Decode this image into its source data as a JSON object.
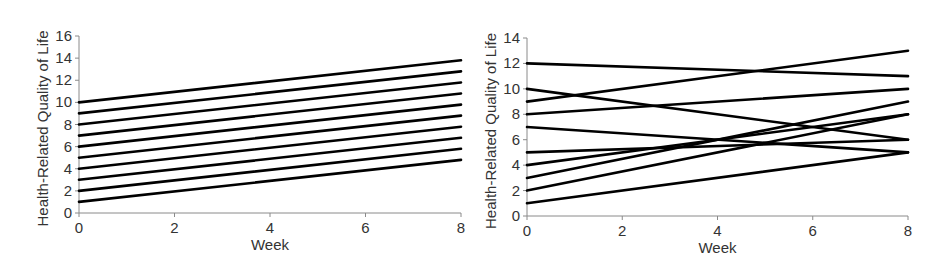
{
  "chart_data": [
    {
      "type": "line",
      "title": "",
      "xlabel": "Week",
      "ylabel": "Health-Related Quality of Life",
      "x": [
        0,
        8
      ],
      "xlim": [
        0,
        8
      ],
      "ylim": [
        0,
        16
      ],
      "xticks": [
        0,
        2,
        4,
        6,
        8
      ],
      "yticks": [
        0,
        2,
        4,
        6,
        8,
        10,
        12,
        14,
        16
      ],
      "grid": false,
      "legend": "none",
      "series": [
        {
          "name": "Subject 1",
          "values": [
            1,
            4.8
          ]
        },
        {
          "name": "Subject 2",
          "values": [
            2,
            5.8
          ]
        },
        {
          "name": "Subject 3",
          "values": [
            3,
            6.8
          ]
        },
        {
          "name": "Subject 4",
          "values": [
            4,
            7.8
          ]
        },
        {
          "name": "Subject 5",
          "values": [
            5,
            8.8
          ]
        },
        {
          "name": "Subject 6",
          "values": [
            6,
            9.8
          ]
        },
        {
          "name": "Subject 7",
          "values": [
            7,
            10.8
          ]
        },
        {
          "name": "Subject 8",
          "values": [
            8,
            11.8
          ]
        },
        {
          "name": "Subject 9",
          "values": [
            9,
            12.8
          ]
        },
        {
          "name": "Subject 10",
          "values": [
            10,
            13.8
          ]
        }
      ]
    },
    {
      "type": "line",
      "title": "",
      "xlabel": "Week",
      "ylabel": "Health-Related Quality of Life",
      "x": [
        0,
        8
      ],
      "xlim": [
        0,
        8
      ],
      "ylim": [
        0,
        14
      ],
      "xticks": [
        0,
        2,
        4,
        6,
        8
      ],
      "yticks": [
        0,
        2,
        4,
        6,
        8,
        10,
        12,
        14
      ],
      "grid": false,
      "legend": "none",
      "series": [
        {
          "name": "Subject 1",
          "values": [
            1,
            5
          ]
        },
        {
          "name": "Subject 2",
          "values": [
            2,
            8
          ]
        },
        {
          "name": "Subject 3",
          "values": [
            3,
            9
          ]
        },
        {
          "name": "Subject 4",
          "values": [
            4,
            8
          ]
        },
        {
          "name": "Subject 5",
          "values": [
            5,
            6
          ]
        },
        {
          "name": "Subject 6",
          "values": [
            7,
            5
          ]
        },
        {
          "name": "Subject 7",
          "values": [
            8,
            10
          ]
        },
        {
          "name": "Subject 8",
          "values": [
            9,
            13
          ]
        },
        {
          "name": "Subject 9",
          "values": [
            10,
            6
          ]
        },
        {
          "name": "Subject 10",
          "values": [
            12,
            11
          ]
        }
      ]
    }
  ],
  "layout": [
    {
      "x0": 79,
      "x1": 461,
      "y0": 213,
      "y1": 36,
      "ytitle_x": 43
    },
    {
      "x0": 527,
      "x1": 908,
      "y0": 216,
      "y1": 38,
      "ytitle_x": 491
    }
  ]
}
